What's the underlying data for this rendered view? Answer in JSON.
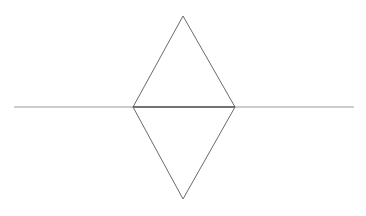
{
  "diagram": {
    "type": "geometric-figure",
    "colors": {
      "background": "#ffffff",
      "line": "#9a9a9a",
      "shape_edge": "#6a6a6a",
      "shared_edge": "#555555"
    },
    "horizontal_line": {
      "x1": 14,
      "y1": 107,
      "x2": 354,
      "y2": 107
    },
    "rhombus": {
      "top": [
        183,
        16
      ],
      "right": [
        235,
        107
      ],
      "bottom": [
        183,
        199
      ],
      "left": [
        133,
        107
      ]
    }
  }
}
